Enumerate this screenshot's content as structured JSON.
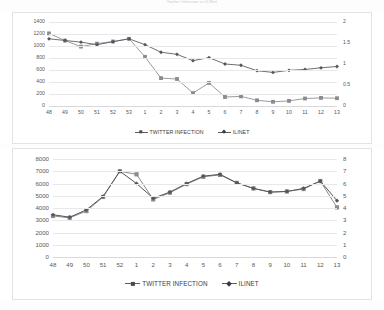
{
  "document": {
    "title": "Twitter Infection vs ILINet"
  },
  "chart_data": [
    {
      "type": "line",
      "id": "chart-1",
      "title": "",
      "xlabel": "",
      "ylabel": "",
      "categories": [
        "48",
        "49",
        "50",
        "51",
        "52",
        "53",
        "1",
        "2",
        "3",
        "4",
        "5",
        "6",
        "7",
        "8",
        "9",
        "10",
        "11",
        "12",
        "13"
      ],
      "left_axis": {
        "label": "",
        "ylim": [
          0,
          1400
        ],
        "ticks": [
          "0",
          "200",
          "400",
          "600",
          "800",
          "1000",
          "1200",
          "1400"
        ]
      },
      "right_axis": {
        "label": "",
        "ylim": [
          0,
          2
        ],
        "ticks": [
          "0",
          "0.5",
          "1",
          "1.5",
          "2"
        ]
      },
      "grid": true,
      "legend_position": "bottom",
      "series": [
        {
          "name": "TWITTER INFECTION",
          "axis": "left",
          "marker": "square",
          "color": "#8a8a8f",
          "values": [
            1210,
            1090,
            990,
            1040,
            1075,
            1120,
            820,
            465,
            450,
            215,
            385,
            150,
            160,
            95,
            70,
            85,
            125,
            135,
            130
          ]
        },
        {
          "name": "ILINET",
          "axis": "right",
          "marker": "diamond",
          "color": "#55555a",
          "values": [
            1.6,
            1.56,
            1.52,
            1.46,
            1.53,
            1.6,
            1.46,
            1.28,
            1.23,
            1.08,
            1.15,
            1.0,
            0.97,
            0.84,
            0.8,
            0.85,
            0.87,
            0.91,
            0.94
          ]
        }
      ]
    },
    {
      "type": "line",
      "id": "chart-2",
      "title": "",
      "xlabel": "",
      "ylabel": "",
      "categories": [
        "48",
        "49",
        "50",
        "51",
        "52",
        "1",
        "2",
        "3",
        "4",
        "5",
        "6",
        "7",
        "8",
        "9",
        "10",
        "11",
        "12",
        "13"
      ],
      "left_axis": {
        "label": "",
        "ylim": [
          0,
          8000
        ],
        "ticks": [
          "0",
          "1000",
          "2000",
          "3000",
          "4000",
          "5000",
          "6000",
          "7000",
          "8000"
        ]
      },
      "right_axis": {
        "label": "",
        "ylim": [
          0,
          8
        ],
        "ticks": [
          "0",
          "1",
          "2",
          "3",
          "4",
          "5",
          "6",
          "7",
          "8"
        ]
      },
      "grid": true,
      "legend_position": "bottom",
      "series": [
        {
          "name": "TWITTER INFECTION",
          "axis": "left",
          "marker": "square",
          "color": "#8a8a8f",
          "values": [
            3350,
            3200,
            3750,
            4900,
            7000,
            6750,
            4700,
            5250,
            5950,
            6550,
            6700,
            6050,
            5600,
            5300,
            5350,
            5550,
            6200,
            4050
          ]
        },
        {
          "name": "ILINET",
          "axis": "right",
          "marker": "diamond",
          "color": "#55555a",
          "values": [
            3.45,
            3.25,
            3.85,
            4.95,
            7.0,
            6.0,
            4.8,
            5.3,
            6.0,
            6.6,
            6.75,
            6.05,
            5.6,
            5.3,
            5.35,
            5.6,
            6.2,
            4.6
          ]
        }
      ]
    }
  ],
  "legends": {
    "chart1": [
      {
        "label": "TWITTER INFECTION",
        "marker": "square"
      },
      {
        "label": "ILINET",
        "marker": "diamond"
      }
    ],
    "chart2": [
      {
        "label": "TWITTER INFECTION",
        "marker": "square"
      },
      {
        "label": "ILINET",
        "marker": "diamond"
      }
    ]
  }
}
